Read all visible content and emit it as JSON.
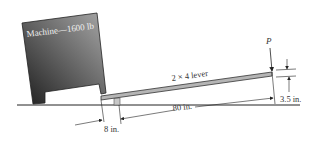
{
  "diagram": {
    "machine_label": "Machine—1600 lb",
    "lever_label": "2 × 4 lever",
    "force_label": "P",
    "dim_lever_length": "80 in.",
    "dim_short_arm": "8 in.",
    "dim_height": "3.5 in."
  },
  "colors": {
    "machine_dark": "#2a2a2a",
    "machine_light": "#9a9a9a",
    "lever": "#b5b5b5",
    "ground": "#222222",
    "text_on_machine": "#f0f0f0"
  }
}
